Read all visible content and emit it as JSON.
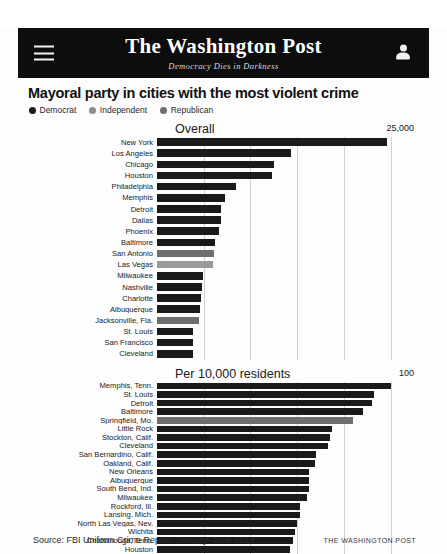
{
  "header": {
    "menu_icon": "hamburger-icon",
    "masthead_name": "The Washington Post",
    "masthead_slogan": "Democracy Dies in Darkness",
    "account_icon": "user-avatar-icon",
    "background": "#0d0d0d"
  },
  "headline": "Mayoral party in cities with the most violent crime",
  "legend": {
    "items": [
      {
        "label": "Democrat",
        "color": "#1a1a1a"
      },
      {
        "label": "Independent",
        "color": "#8c8c8c"
      },
      {
        "label": "Republican",
        "color": "#6e6e6e"
      }
    ]
  },
  "colors": {
    "democrat": "#1a1a1a",
    "independent": "#9a9a9a",
    "republican": "#6e6e6e",
    "gridline": "#cfcfcf"
  },
  "footer": {
    "source": "Source: FBI Uniform Crime Report, January–June 2019",
    "credit": "THE WASHINGTON POST"
  },
  "chart_data": [
    {
      "type": "bar",
      "orientation": "horizontal",
      "title": "Overall",
      "xlabel": "",
      "ylabel": "",
      "xlim": [
        0,
        27500
      ],
      "axis_max_label": "25,000",
      "grid": true,
      "gridlines": [
        5000,
        10000,
        15000,
        20000,
        25000
      ],
      "legend_position": "top",
      "categories": [
        "New York",
        "Los Angeles",
        "Chicago",
        "Houston",
        "Philadelphia",
        "Memphis",
        "Detroit",
        "Dallas",
        "Phoenix",
        "Baltimore",
        "San Antonio",
        "Las Vegas",
        "Milwaukee",
        "Nashville",
        "Charlotte",
        "Albuquerque",
        "Jacksonville, Fla.",
        "St. Louis",
        "San Francisco",
        "Cleveland"
      ],
      "values": [
        24600,
        14300,
        12500,
        12300,
        8400,
        7300,
        6900,
        6800,
        6600,
        6200,
        6100,
        6000,
        4900,
        4800,
        4700,
        4600,
        4500,
        3900,
        3800,
        3800
      ],
      "parties": [
        "Democrat",
        "Democrat",
        "Democrat",
        "Democrat",
        "Democrat",
        "Democrat",
        "Democrat",
        "Democrat",
        "Democrat",
        "Democrat",
        "Republican",
        "Independent",
        "Democrat",
        "Democrat",
        "Democrat",
        "Democrat",
        "Republican",
        "Democrat",
        "Democrat",
        "Democrat"
      ]
    },
    {
      "type": "bar",
      "orientation": "horizontal",
      "title": "Per 10,000 residents",
      "xlabel": "",
      "ylabel": "",
      "xlim": [
        0,
        110
      ],
      "axis_max_label": "100",
      "grid": true,
      "gridlines": [
        20,
        40,
        60,
        80,
        100
      ],
      "legend_position": "top",
      "categories": [
        "Memphis, Tenn.",
        "St. Louis",
        "Detroit",
        "Baltimore",
        "Springfield, Mo.",
        "Little Rock",
        "Stockton, Calif.",
        "Cleveland",
        "San Bernardino, Calif.",
        "Oakland, Calif.",
        "New Orleans",
        "Albuquerque",
        "South Bend, Ind.",
        "Milwaukee",
        "Rockford, Ill.",
        "Lansing, Mich.",
        "North Las Vegas, Nev.",
        "Wichita",
        "Chattanooga, Tenn.",
        "Houston"
      ],
      "values": [
        100.0,
        93.0,
        92.0,
        88.0,
        84.0,
        75.0,
        74.0,
        73.0,
        68.0,
        67.5,
        65.0,
        65.0,
        65.0,
        64.0,
        61.0,
        61.0,
        60.0,
        59.0,
        58.0,
        57.0
      ],
      "parties": [
        "Democrat",
        "Democrat",
        "Democrat",
        "Democrat",
        "Republican",
        "Democrat",
        "Democrat",
        "Democrat",
        "Democrat",
        "Democrat",
        "Democrat",
        "Democrat",
        "Democrat",
        "Democrat",
        "Democrat",
        "Democrat",
        "Democrat",
        "Democrat",
        "Democrat",
        "Democrat"
      ]
    }
  ]
}
